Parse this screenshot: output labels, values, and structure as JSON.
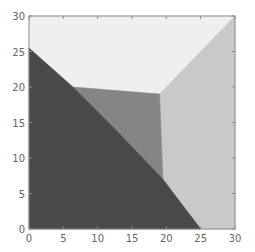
{
  "chart_data": {
    "type": "area",
    "title": "",
    "xlabel": "",
    "ylabel": "",
    "xlim": [
      0,
      30
    ],
    "ylim": [
      0,
      30
    ],
    "grid": false,
    "legend": null,
    "x_ticks": [
      0,
      5,
      10,
      15,
      20,
      25,
      30
    ],
    "y_ticks": [
      0,
      5,
      10,
      15,
      20,
      25,
      30
    ],
    "x_tick_labels": [
      "0",
      "5",
      "10",
      "15",
      "20",
      "25",
      "30"
    ],
    "y_tick_labels": [
      "0",
      "5",
      "10",
      "15",
      "20",
      "25",
      "30"
    ],
    "regions": [
      {
        "name": "top-region",
        "color": "#efefef",
        "polygon": [
          [
            0,
            30
          ],
          [
            30,
            30
          ],
          [
            19,
            19
          ],
          [
            6.4,
            20
          ],
          [
            0,
            25.5
          ]
        ]
      },
      {
        "name": "right-region",
        "color": "#c9c9c9",
        "polygon": [
          [
            19,
            19
          ],
          [
            30,
            30
          ],
          [
            30,
            0
          ],
          [
            25,
            0
          ],
          [
            19.5,
            7
          ]
        ]
      },
      {
        "name": "middle-region",
        "color": "#858585",
        "polygon": [
          [
            6.4,
            20
          ],
          [
            19,
            19
          ],
          [
            19.5,
            7
          ],
          [
            13,
            13.6
          ]
        ]
      },
      {
        "name": "bottom-left-region",
        "color": "#4a4848",
        "polygon": [
          [
            0,
            0
          ],
          [
            0,
            25.5
          ],
          [
            6.4,
            20
          ],
          [
            13,
            13.6
          ],
          [
            19.5,
            7
          ],
          [
            25,
            0
          ]
        ]
      }
    ],
    "vertices": {
      "left_intercept": [
        0,
        25.5
      ],
      "upper_left_junction": [
        6.4,
        20
      ],
      "upper_right_junction": [
        19,
        19
      ],
      "lower_junction": [
        19.5,
        7
      ],
      "bottom_intercept": [
        25,
        0
      ],
      "top_right_corner": [
        30,
        30
      ]
    },
    "axis_color": "#8a8a8a"
  }
}
